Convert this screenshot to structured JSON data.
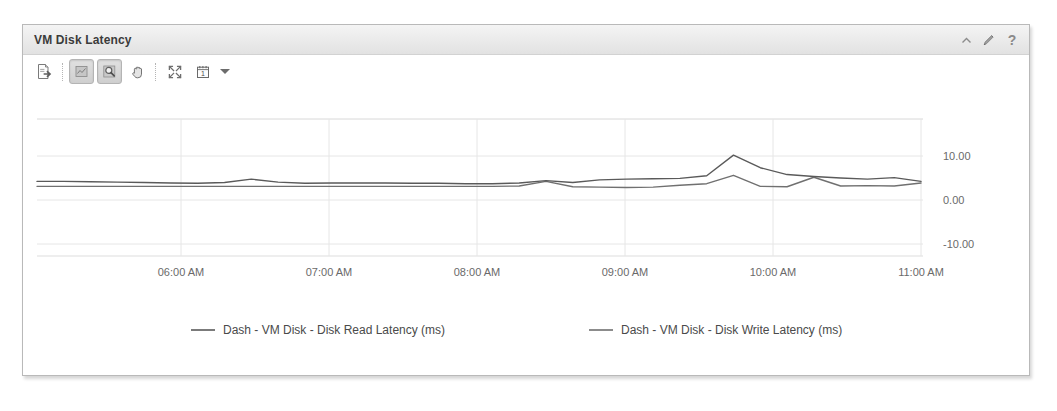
{
  "panel": {
    "title": "VM Disk Latency",
    "header_tools": [
      {
        "name": "collapse-icon",
        "glyph": "collapse",
        "label": "Collapse"
      },
      {
        "name": "edit-icon",
        "glyph": "pencil",
        "label": "Edit"
      },
      {
        "name": "help-icon",
        "glyph": "?",
        "label": "Help"
      }
    ]
  },
  "toolbar": {
    "buttons": [
      {
        "name": "export-button",
        "icon": "export-icon",
        "label": "Export",
        "pressed": false
      },
      {
        "name": "pan-mode-button",
        "icon": "pan-select-icon",
        "label": "Select",
        "pressed": true
      },
      {
        "name": "zoom-mode-button",
        "icon": "zoom-magnifier-icon",
        "label": "Zoom",
        "pressed": true
      },
      {
        "name": "hand-tool-button",
        "icon": "hand-icon",
        "label": "Pan",
        "pressed": false
      },
      {
        "name": "fit-to-screen-button",
        "icon": "expand-arrows-icon",
        "label": "Fit to screen",
        "pressed": false
      },
      {
        "name": "date-range-button",
        "icon": "calendar-icon",
        "label": "1",
        "pressed": false
      }
    ],
    "date_dropdown_label": "1"
  },
  "colors": {
    "read_line": "#5a5a5a",
    "write_line": "#707070",
    "grid": "#e3e3e3",
    "axis_label": "#6a6a6a",
    "panel_border": "#b9b9b9",
    "header_bg": "#eaeaea"
  },
  "chart_data": {
    "type": "line",
    "title": "VM Disk Latency",
    "xlabel": "",
    "ylabel": "",
    "ylim": [
      -18,
      18
    ],
    "yticks": [
      10,
      0,
      -10
    ],
    "ytick_labels": [
      "10.00",
      "0.00",
      "-10.00"
    ],
    "grid": true,
    "legend_position": "bottom",
    "x": [
      "05:30 AM",
      "05:40 AM",
      "05:50 AM",
      "06:00 AM",
      "06:10 AM",
      "06:20 AM",
      "06:30 AM",
      "06:40 AM",
      "06:50 AM",
      "07:00 AM",
      "07:10 AM",
      "07:20 AM",
      "07:30 AM",
      "07:40 AM",
      "07:50 AM",
      "08:00 AM",
      "08:10 AM",
      "08:20 AM",
      "08:30 AM",
      "08:40 AM",
      "08:50 AM",
      "09:00 AM",
      "09:10 AM",
      "09:20 AM",
      "09:30 AM",
      "09:40 AM",
      "09:50 AM",
      "10:00 AM",
      "10:10 AM",
      "10:20 AM",
      "10:30 AM",
      "10:40 AM",
      "10:50 AM",
      "11:00 AM"
    ],
    "xtick_labels": [
      "06:00 AM",
      "07:00 AM",
      "08:00 AM",
      "09:00 AM",
      "10:00 AM",
      "11:00 AM"
    ],
    "series": [
      {
        "name": "Dash - VM Disk - Disk Read Latency (ms)",
        "color": "#5a5a5a",
        "values": [
          1.6,
          1.6,
          1.5,
          1.4,
          1.3,
          1.2,
          1.1,
          1.3,
          2.2,
          1.4,
          1.1,
          1.2,
          1.2,
          1.2,
          1.1,
          1.1,
          1.0,
          1.0,
          1.2,
          1.8,
          1.3,
          2.0,
          2.2,
          2.3,
          2.4,
          3.1,
          8.5,
          5.2,
          3.4,
          2.9,
          2.5,
          2.2,
          2.6,
          1.6
        ]
      },
      {
        "name": "Dash - VM Disk - Disk Write Latency (ms)",
        "color": "#707070",
        "values": [
          0.3,
          0.3,
          0.3,
          0.3,
          0.3,
          0.3,
          0.3,
          0.3,
          0.3,
          0.3,
          0.3,
          0.3,
          0.3,
          0.3,
          0.3,
          0.3,
          0.3,
          0.3,
          0.4,
          1.6,
          0.2,
          0.1,
          0.0,
          0.1,
          0.6,
          1.0,
          3.2,
          0.3,
          0.2,
          2.7,
          0.4,
          0.5,
          0.4,
          1.2
        ]
      }
    ]
  },
  "legend": [
    {
      "label": "Dash - VM Disk - Disk Read Latency (ms)",
      "color": "#5a5a5a"
    },
    {
      "label": "Dash - VM Disk - Disk Write Latency (ms)",
      "color": "#707070"
    }
  ]
}
